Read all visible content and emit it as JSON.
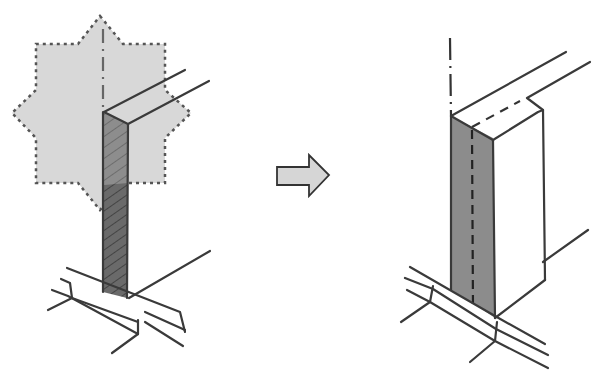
{
  "diagram": {
    "panels": [
      {
        "id": "before",
        "description": "column with starred highlighted region at wall junction, lower part hatched dark"
      },
      {
        "id": "after",
        "description": "column extended into wall section, shaded front face with dashed centerline"
      }
    ],
    "arrow": {
      "direction": "right"
    },
    "colors": {
      "ink": "#3a3a3a",
      "highlight_fill": "#d8d8d8",
      "highlight_border": "#555555",
      "column_fill_dark": "#6a6a6a",
      "column_fill_mid": "#8a8a8a",
      "face_fill": "#8c8c8c",
      "arrow_fill": "#d6d6d6"
    }
  }
}
